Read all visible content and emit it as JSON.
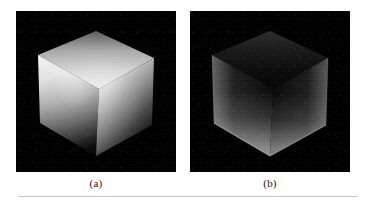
{
  "figure": {
    "background_color": "#ffffff",
    "panel_background_color": "#000000",
    "rule_color": "#c9c9c9",
    "panels": [
      {
        "id": "a",
        "caption": "(a)",
        "subject": "shaded-cube",
        "description": "Brightly lit grey cube on black background, top-front vertex facing viewer, illuminated from above; faces fall off to black toward the lower vertex.",
        "lighting": "diffuse-overhead",
        "faces": {
          "top": {
            "name": "top-face",
            "bright_value": "#d8d8d8",
            "dark_value": "#6a6a6a"
          },
          "left": {
            "name": "left-face",
            "bright_value": "#e6e6e6",
            "dark_value": "#0d0d0d"
          },
          "right": {
            "name": "right-face",
            "bright_value": "#cfcfcf",
            "dark_value": "#070707"
          }
        }
      },
      {
        "id": "b",
        "caption": "(b)",
        "subject": "shaded-cube",
        "description": "Same cube rendered very dark with rim highlights along the lower-left and lower-right silhouette edges; backlit appearance.",
        "lighting": "rim-backlight",
        "faces": {
          "top": {
            "name": "top-face",
            "bright_value": "#2b2b2b",
            "dark_value": "#050505"
          },
          "left": {
            "name": "left-face",
            "bright_value": "#9a9a9a",
            "dark_value": "#060606"
          },
          "right": {
            "name": "right-face",
            "bright_value": "#8d8d8d",
            "dark_value": "#050505"
          }
        }
      }
    ]
  }
}
